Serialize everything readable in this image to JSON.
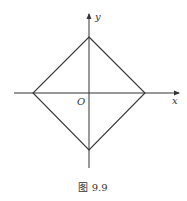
{
  "figure": {
    "caption": "图 9.9",
    "axes": {
      "x_label": "x",
      "y_label": "y",
      "origin_label": "O"
    },
    "shape": {
      "type": "square (rotated 45°, diamond)",
      "vertices": [
        {
          "name": "top",
          "x": 0,
          "y": 1
        },
        {
          "name": "right",
          "x": 1,
          "y": 0
        },
        {
          "name": "bottom",
          "x": 0,
          "y": -1
        },
        {
          "name": "left",
          "x": -1,
          "y": 0
        }
      ]
    },
    "colors": {
      "line": "#333333",
      "background": "#ffffff"
    }
  }
}
